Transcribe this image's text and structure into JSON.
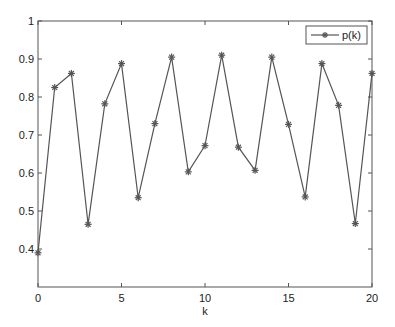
{
  "chart_data": {
    "type": "line",
    "title": "",
    "xlabel": "k",
    "ylabel": "",
    "xlim": [
      0,
      20
    ],
    "ylim": [
      0.3,
      1
    ],
    "grid": false,
    "legend_position": "upper right",
    "x_ticks": [
      "0",
      "5",
      "10",
      "15",
      "20"
    ],
    "y_ticks": [
      "0.4",
      "0.5",
      "0.6",
      "0.7",
      "0.8",
      "0.9",
      "1"
    ],
    "x": [
      0,
      1,
      2,
      3,
      4,
      5,
      6,
      7,
      8,
      9,
      10,
      11,
      12,
      13,
      14,
      15,
      16,
      17,
      18,
      19,
      20
    ],
    "series": [
      {
        "name": "p(k)",
        "marker": "asterisk",
        "color": "#555555",
        "values": [
          0.39,
          0.825,
          0.862,
          0.465,
          0.782,
          0.888,
          0.535,
          0.73,
          0.905,
          0.603,
          0.672,
          0.91,
          0.668,
          0.607,
          0.905,
          0.728,
          0.537,
          0.888,
          0.778,
          0.467,
          0.862
        ]
      }
    ]
  }
}
